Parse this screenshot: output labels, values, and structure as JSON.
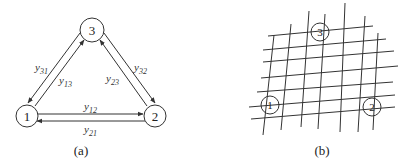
{
  "diagram_a": {
    "caption": "(a)",
    "nodes": [
      {
        "id": "1",
        "label": "1",
        "cx": 27,
        "cy": 116,
        "r": 11
      },
      {
        "id": "2",
        "label": "2",
        "cx": 155,
        "cy": 116,
        "r": 11
      },
      {
        "id": "3",
        "label": "3",
        "cx": 92,
        "cy": 30,
        "r": 12
      }
    ],
    "edges": [
      {
        "from": "3",
        "to": "1",
        "label": "y",
        "sub": "31"
      },
      {
        "from": "1",
        "to": "3",
        "label": "y",
        "sub": "13"
      },
      {
        "from": "2",
        "to": "3",
        "label": "y",
        "sub": "23"
      },
      {
        "from": "3",
        "to": "2",
        "label": "y",
        "sub": "32"
      },
      {
        "from": "1",
        "to": "2",
        "label": "y",
        "sub": "12"
      },
      {
        "from": "2",
        "to": "1",
        "label": "y",
        "sub": "21"
      }
    ]
  },
  "diagram_b": {
    "caption": "(b)",
    "nodes": [
      {
        "id": "1",
        "label": "1"
      },
      {
        "id": "2",
        "label": "2"
      },
      {
        "id": "3",
        "label": "3"
      }
    ]
  },
  "colors": {
    "stroke": "#333333",
    "background": "#ffffff"
  }
}
